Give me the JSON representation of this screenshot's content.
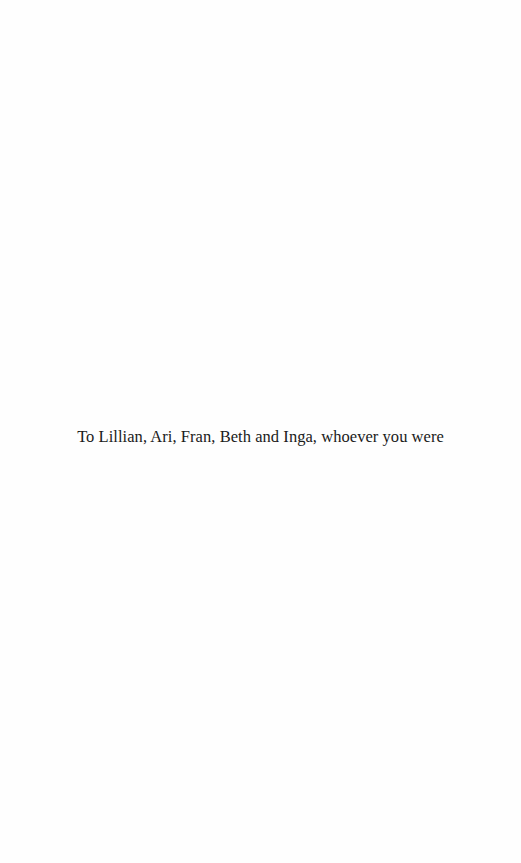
{
  "page": {
    "type": "dedication",
    "dedication_text": "To Lillian, Ari, Fran, Beth and Inga, whoever you were"
  }
}
